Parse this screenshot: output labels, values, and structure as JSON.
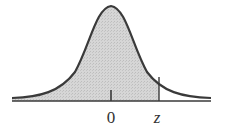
{
  "diagram": {
    "type": "normal-distribution-curve",
    "shaded_region": "left tail up to z",
    "labels": {
      "mean": "0",
      "z": "z"
    },
    "colors": {
      "curve": "#3a3a3a",
      "shade": "#cfcfcf",
      "axis": "#3a3a3a"
    }
  }
}
